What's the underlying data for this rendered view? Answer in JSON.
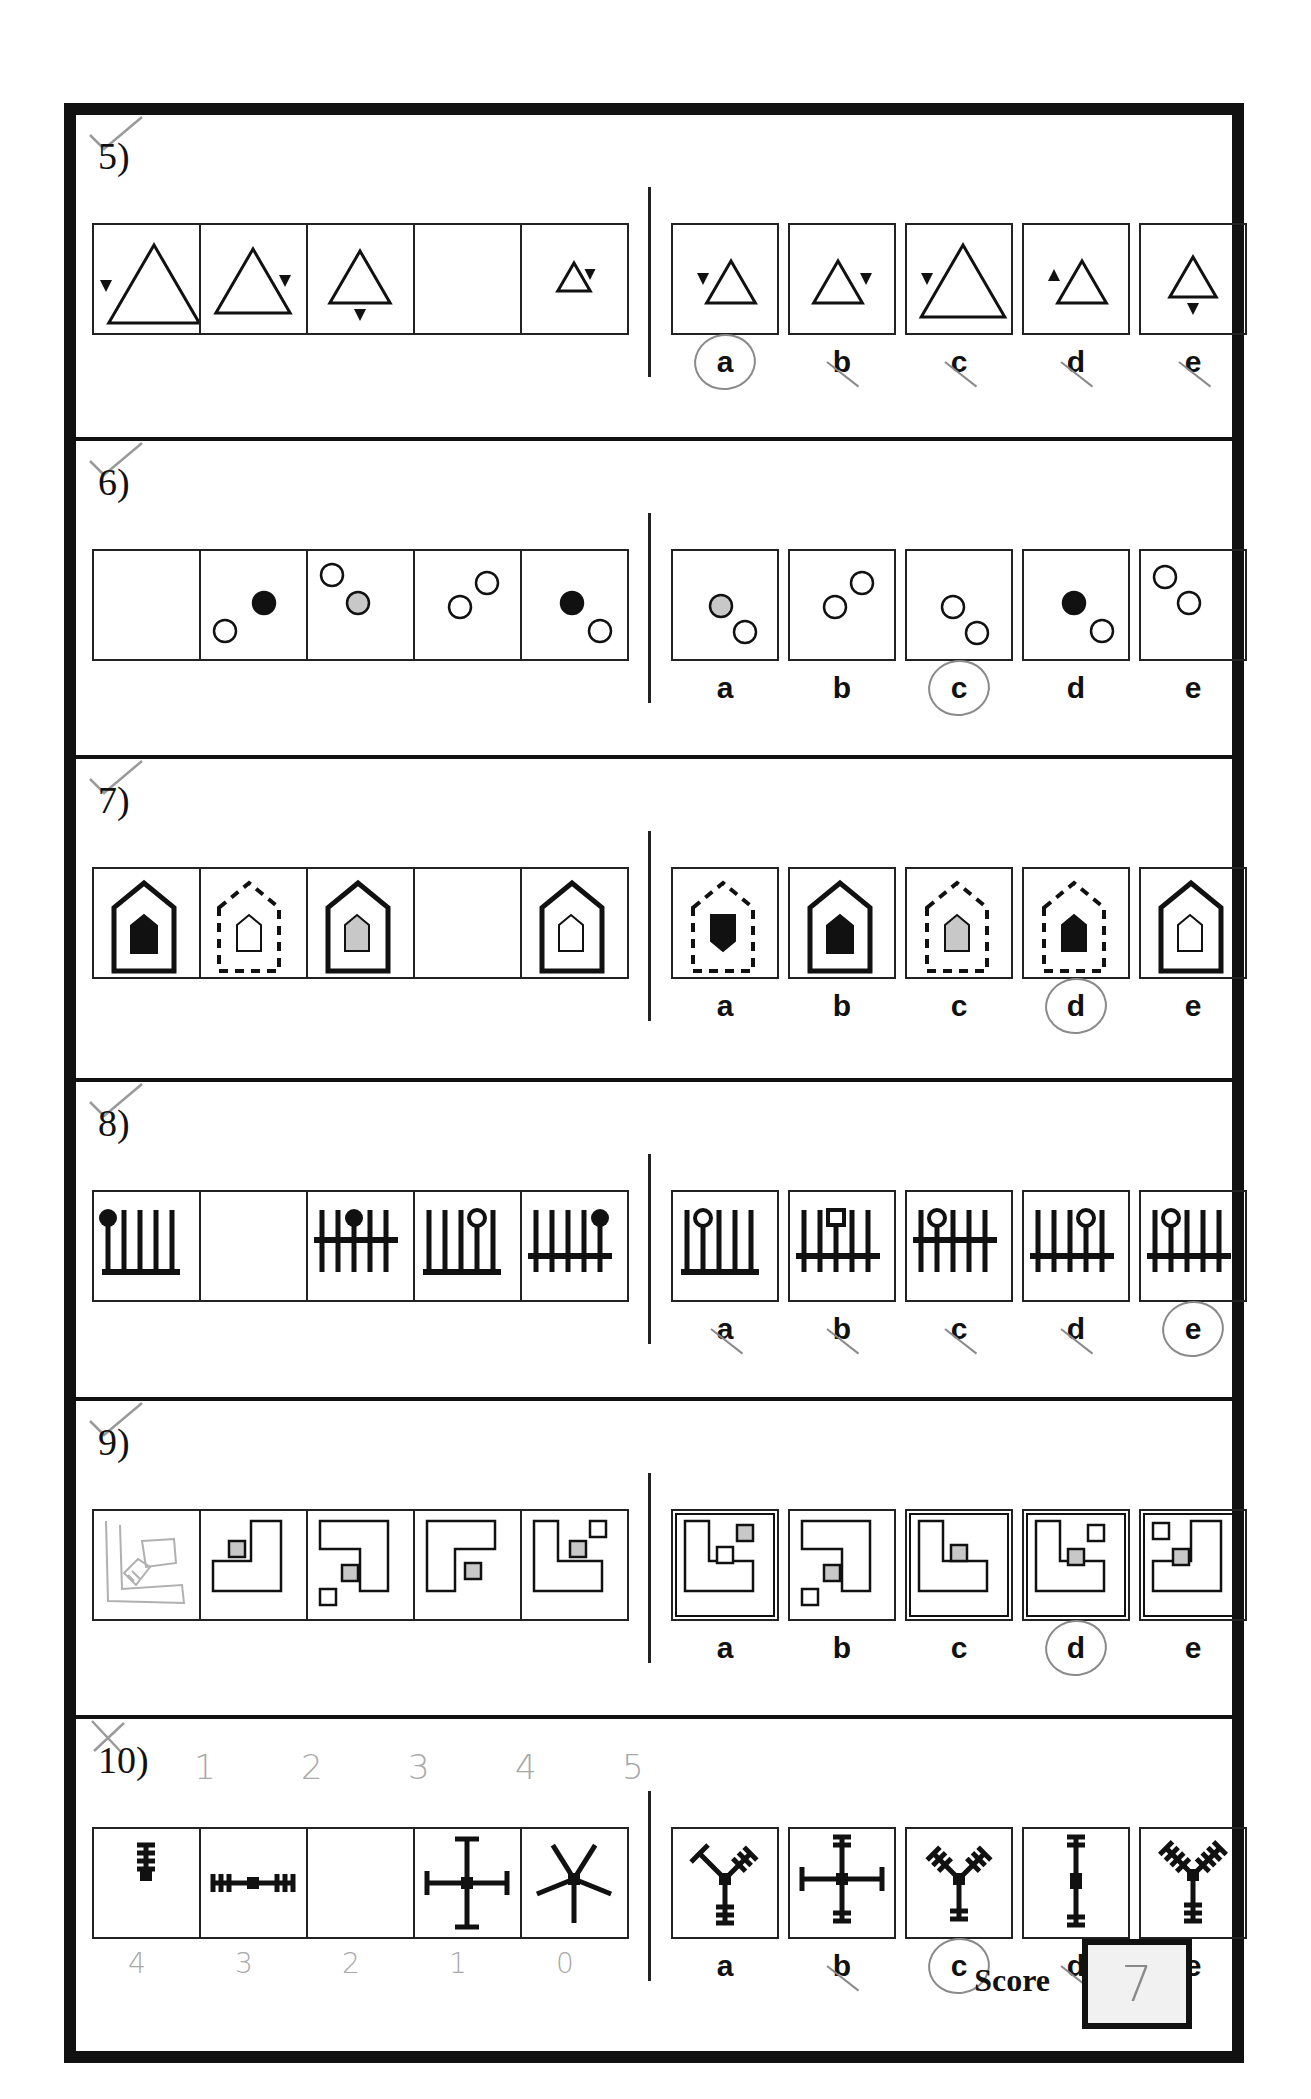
{
  "page": {
    "score_label": "Score",
    "score_value": "7"
  },
  "questions": [
    {
      "number": "5)",
      "graded": "correct",
      "sequence": [
        "big-triangle-left-marker",
        "triangle-right-marker",
        "triangle-bottom-marker",
        "blank",
        "small-triangle-right-marker"
      ],
      "options": [
        {
          "label": "a",
          "figure": "triangle-left-marker-down",
          "mark": "circled"
        },
        {
          "label": "b",
          "figure": "triangle-right-marker-down",
          "mark": "struck"
        },
        {
          "label": "c",
          "figure": "big-triangle-left-marker-down",
          "mark": "struck"
        },
        {
          "label": "d",
          "figure": "triangle-left-marker-up",
          "mark": "struck"
        },
        {
          "label": "e",
          "figure": "triangle-bottom-marker-down",
          "mark": "struck"
        }
      ]
    },
    {
      "number": "6)",
      "graded": "correct",
      "sequence": [
        "blank",
        "black-upper-right-white-lower-left",
        "white-upper-left-grey-lower-right",
        "white-lower-left-white-upper-right",
        "black-upper-left-white-lower-right"
      ],
      "options": [
        {
          "label": "a",
          "figure": "grey-upper-left-white-lower-right",
          "mark": "none"
        },
        {
          "label": "b",
          "figure": "white-lower-left-white-upper-right",
          "mark": "none"
        },
        {
          "label": "c",
          "figure": "white-upper-left-white-lower-right",
          "mark": "circled"
        },
        {
          "label": "d",
          "figure": "black-upper-left-white-lower-right",
          "mark": "none"
        },
        {
          "label": "e",
          "figure": "white-upper-left-white-lower-right-top",
          "mark": "none"
        }
      ]
    },
    {
      "number": "7)",
      "graded": "correct",
      "sequence": [
        "solid-house-black-inner",
        "dashed-house-white-inner",
        "solid-house-grey-inner",
        "blank",
        "solid-house-white-inner"
      ],
      "options": [
        {
          "label": "a",
          "figure": "dashed-house-black-shield",
          "mark": "none"
        },
        {
          "label": "b",
          "figure": "solid-house-black-inner",
          "mark": "none"
        },
        {
          "label": "c",
          "figure": "dashed-house-grey-inner",
          "mark": "none"
        },
        {
          "label": "d",
          "figure": "dashed-house-black-inner",
          "mark": "circled"
        },
        {
          "label": "e",
          "figure": "solid-house-white-inner",
          "mark": "none"
        }
      ]
    },
    {
      "number": "8)",
      "graded": "correct",
      "sequence": [
        "comb-bottom-black-knob-1",
        "blank",
        "comb-middle-black-knob-3",
        "comb-bottom-white-knob-4",
        "comb-low-black-knob-5"
      ],
      "options": [
        {
          "label": "a",
          "figure": "comb-bottom-white-knob-2",
          "mark": "struck"
        },
        {
          "label": "b",
          "figure": "comb-low-square-knob-3",
          "mark": "struck"
        },
        {
          "label": "c",
          "figure": "comb-middle-white-knob-2",
          "mark": "struck"
        },
        {
          "label": "d",
          "figure": "comb-low-white-knob-4",
          "mark": "struck"
        },
        {
          "label": "e",
          "figure": "comb-low-white-knob-2",
          "mark": "circled"
        }
      ]
    },
    {
      "number": "9)",
      "graded": "correct",
      "sequence": [
        "pencil-sketch",
        "j-shape-grey-square",
        "hook-grey-square-white-square",
        "r-shape-grey-square",
        "l-shape-grey-square-white-square"
      ],
      "options": [
        {
          "label": "a",
          "figure": "l-shape-grey-top-white-mid",
          "mark": "none"
        },
        {
          "label": "b",
          "figure": "hook-grey-square-white-square",
          "mark": "none"
        },
        {
          "label": "c",
          "figure": "l-shape-grey-square",
          "mark": "none"
        },
        {
          "label": "d",
          "figure": "l-shape-white-top-grey-mid",
          "mark": "circled"
        },
        {
          "label": "e",
          "figure": "j-shape-white-top-grey-mid",
          "mark": "none"
        }
      ]
    },
    {
      "number": "10)",
      "graded": "incorrect",
      "top_annotations": [
        "1",
        "2",
        "3",
        "4",
        "5"
      ],
      "bottom_annotations": [
        "4",
        "3",
        "2",
        "1",
        "0"
      ],
      "sequence": [
        "single-arm-four-bars",
        "two-arms-three-bars",
        "blank",
        "four-arms-one-bar",
        "five-arms-no-bars"
      ],
      "options": [
        {
          "label": "a",
          "figure": "y-mixed-bars",
          "mark": "none"
        },
        {
          "label": "b",
          "figure": "cross-two-bars",
          "mark": "struck"
        },
        {
          "label": "c",
          "figure": "y-two-bars",
          "mark": "circled-check"
        },
        {
          "label": "d",
          "figure": "vertical-two-bars",
          "mark": "struck"
        },
        {
          "label": "e",
          "figure": "y-three-bars",
          "mark": "none"
        }
      ]
    }
  ]
}
